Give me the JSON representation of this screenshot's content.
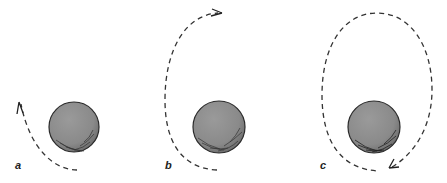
{
  "figure": {
    "panels": [
      {
        "label": "a",
        "trajectory": "short arc",
        "direction": "upward"
      },
      {
        "label": "b",
        "trajectory": "half orbit",
        "direction": "upward then right"
      },
      {
        "label": "c",
        "trajectory": "closed elliptical orbit",
        "direction": "clockwise"
      }
    ],
    "colors": {
      "planet_fill": "#8e8e8e",
      "planet_outline": "#2a2a2a",
      "trajectory": "#333333"
    }
  }
}
